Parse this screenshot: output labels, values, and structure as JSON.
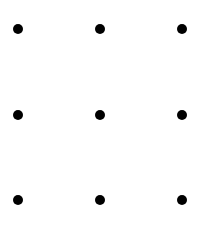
{
  "diagram": {
    "type": "dot-grid",
    "rows": 3,
    "columns": 3,
    "background": "#ffffff",
    "dot_color": "#000000",
    "dot_diameter": 10,
    "column_x": [
      18,
      100,
      182
    ],
    "row_y": [
      29,
      115,
      200
    ],
    "dots": [
      {
        "row": 0,
        "col": 0,
        "x": 18,
        "y": 29
      },
      {
        "row": 0,
        "col": 1,
        "x": 100,
        "y": 29
      },
      {
        "row": 0,
        "col": 2,
        "x": 182,
        "y": 29
      },
      {
        "row": 1,
        "col": 0,
        "x": 18,
        "y": 115
      },
      {
        "row": 1,
        "col": 1,
        "x": 100,
        "y": 115
      },
      {
        "row": 1,
        "col": 2,
        "x": 182,
        "y": 115
      },
      {
        "row": 2,
        "col": 0,
        "x": 18,
        "y": 200
      },
      {
        "row": 2,
        "col": 1,
        "x": 100,
        "y": 200
      },
      {
        "row": 2,
        "col": 2,
        "x": 182,
        "y": 200
      }
    ]
  }
}
